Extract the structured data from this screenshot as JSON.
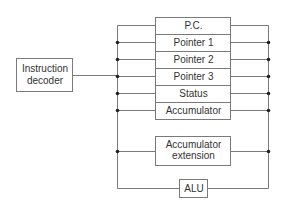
{
  "diagram": {
    "decoder": {
      "label_line1": "Instruction",
      "label_line2": "decoder"
    },
    "registers": [
      "P.C.",
      "Pointer 1",
      "Pointer 2",
      "Pointer 3",
      "Status",
      "Accumulator"
    ],
    "accumulator_extension": {
      "line1": "Accumulator",
      "line2": "extension"
    },
    "alu": {
      "label": "ALU"
    },
    "colors": {
      "line": "#7a7a7a",
      "dot": "#222222",
      "text": "#333333"
    }
  }
}
